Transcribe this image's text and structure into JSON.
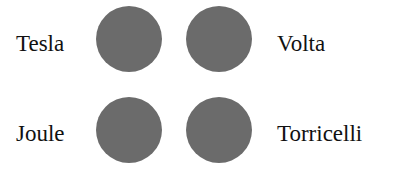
{
  "labels": {
    "top_left": "Tesla",
    "top_right": "Volta",
    "bottom_left": "Joule",
    "bottom_right": "Torricelli"
  },
  "colors": {
    "circle": "#6b6b6b",
    "text": "#111111",
    "background": "#ffffff"
  }
}
